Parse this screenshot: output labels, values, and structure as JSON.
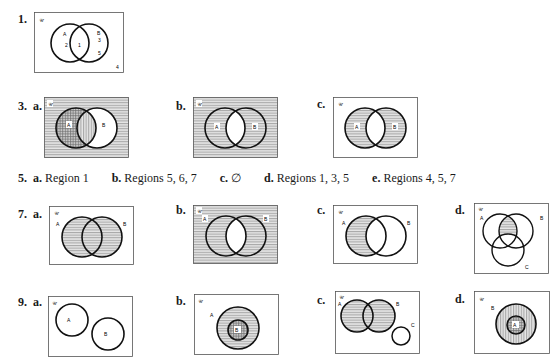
{
  "problems": {
    "p1": {
      "number": "1.",
      "universe": "𝒰",
      "labels": {
        "A": "A",
        "B": "B",
        "r2": "2",
        "r1": "1",
        "r3": "3",
        "r5": "5",
        "r4": "4"
      }
    },
    "p3": {
      "number": "3.",
      "parts": [
        {
          "letter": "a.",
          "universe": "𝒰",
          "A": "A",
          "B": "B"
        },
        {
          "letter": "b.",
          "universe": "𝒰",
          "A": "A",
          "B": "B"
        },
        {
          "letter": "c.",
          "universe": "𝒰",
          "A": "A",
          "B": "B"
        }
      ]
    },
    "p5": {
      "number": "5.",
      "answers": [
        {
          "letter": "a.",
          "text": "Region 1"
        },
        {
          "letter": "b.",
          "text": "Regions 5, 6, 7"
        },
        {
          "letter": "c.",
          "text": "∅"
        },
        {
          "letter": "d.",
          "text": "Regions 1, 3, 5"
        },
        {
          "letter": "e.",
          "text": "Regions 4, 5, 7"
        }
      ]
    },
    "p7": {
      "number": "7.",
      "parts": [
        {
          "letter": "a.",
          "universe": "𝒰",
          "A": "A",
          "B": "B"
        },
        {
          "letter": "b.",
          "universe": "𝒰",
          "A": "A",
          "B": "B"
        },
        {
          "letter": "c.",
          "universe": "𝒰",
          "A": "A",
          "B": "B"
        },
        {
          "letter": "d.",
          "universe": "𝒰",
          "A": "A",
          "B": "B",
          "C": "C"
        }
      ]
    },
    "p9": {
      "number": "9.",
      "parts": [
        {
          "letter": "a.",
          "universe": "𝒰",
          "A": "A",
          "B": "B"
        },
        {
          "letter": "b.",
          "universe": "𝒰",
          "A": "A",
          "B": "B"
        },
        {
          "letter": "c.",
          "universe": "𝒰",
          "A": "A",
          "B": "B",
          "C": "C"
        },
        {
          "letter": "d.",
          "universe": "𝒰",
          "A": "A",
          "B": "B"
        }
      ]
    }
  },
  "colors": {
    "ink": "#1a1a1a",
    "hatch": "#9a9a9a",
    "paper": "#ffffff"
  }
}
